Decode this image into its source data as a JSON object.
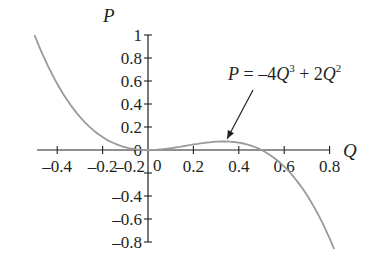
{
  "chart_data": {
    "type": "line",
    "title": "",
    "xlabel": "Q",
    "ylabel": "P",
    "function": "P = -4Q^3 + 2Q^2",
    "annotation": {
      "P": "P",
      "eq": " = ",
      "minus4": "–4",
      "Q1": "Q",
      "exp3": "3",
      "plus2": " + 2",
      "Q2": "Q",
      "exp2": "2",
      "points_to": [
        0.34,
        0.08
      ]
    },
    "xlim": [
      -0.5,
      0.82
    ],
    "ylim": [
      -0.8,
      1.0
    ],
    "grid": false,
    "legend": "none",
    "x_ticks": [
      -0.4,
      -0.2,
      0.2,
      0.4,
      0.6,
      0.8
    ],
    "x_tick_labels": [
      "–0.4",
      "–0.2",
      "0.2",
      "0.4",
      "0.6",
      "0.8"
    ],
    "y_ticks": [
      1,
      0.8,
      0.6,
      0.4,
      0.2,
      0,
      -0.2,
      -0.4,
      -0.6,
      -0.8
    ],
    "y_tick_labels": [
      "1",
      "0.8",
      "0.6",
      "0.4",
      "0.2",
      "0",
      "–0.2",
      "–0.4",
      "–0.6",
      "–0.8"
    ],
    "origin_label": "0",
    "series": [
      {
        "name": "P = -4Q^3 + 2Q^2",
        "color": "#9a9a9a",
        "x": [
          -0.5,
          -0.4,
          -0.3,
          -0.2,
          -0.1,
          0.0,
          0.1,
          0.2,
          0.3,
          0.33,
          0.4,
          0.5,
          0.6,
          0.7,
          0.8
        ],
        "y": [
          1.0,
          0.576,
          0.288,
          0.112,
          0.024,
          0.0,
          0.016,
          0.048,
          0.072,
          0.074,
          0.064,
          0.0,
          -0.144,
          -0.392,
          -0.768
        ]
      }
    ],
    "colors": {
      "axis": "#231f20",
      "curve": "#9a9a9a",
      "text": "#231f20"
    }
  }
}
